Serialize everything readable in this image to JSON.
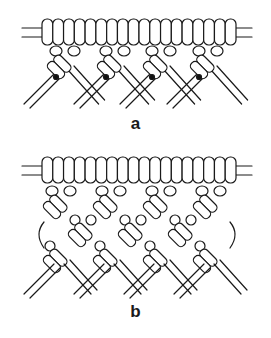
{
  "diagram": {
    "type": "macrame-knot-illustration",
    "colors": {
      "stroke": "#1a1a1a",
      "fill": "#ffffff",
      "shadow": "#111111"
    },
    "panels": [
      {
        "id": "a",
        "label": "a",
        "description": "Holding bar with mounted cords and one row of diagonal knots",
        "bar_segments": 18,
        "knot_groups": 4
      },
      {
        "id": "b",
        "label": "b",
        "description": "Holding bar with mounted cords and alternating rows of diagonal knots forming a lattice",
        "bar_segments": 18,
        "knot_groups": 4
      }
    ]
  }
}
